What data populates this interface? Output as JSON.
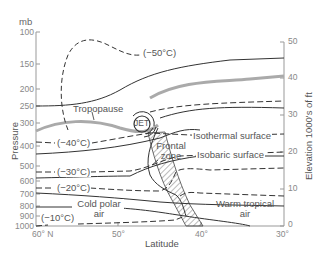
{
  "diagram": {
    "left_axis": {
      "unit": "mb",
      "title": "Pressure",
      "ticks": [
        "100",
        "150",
        "200",
        "250",
        "300",
        "400",
        "500",
        "600",
        "700",
        "800",
        "900",
        "1000"
      ]
    },
    "right_axis": {
      "title": "Elevation  1000's of ft",
      "ticks": [
        "50",
        "40",
        "30",
        "20",
        "10",
        "0"
      ]
    },
    "bottom_axis": {
      "title": "Latitude",
      "ticks": [
        "60° N",
        "50°",
        "40°",
        "30°"
      ]
    },
    "labels": {
      "t_minus50": "(−50°C)",
      "t_minus40": "(−40°C)",
      "t_minus30": "(−30°C)",
      "t_minus20": "(−20°C)",
      "t_minus10": "(−10°C)",
      "tropopause": "Tropopause",
      "jet": "JET",
      "frontal_zone": "Frontal zone",
      "isothermal_surface": "Isothermal surface",
      "isobaric_surface": "Isobaric surface",
      "cold_polar_air": "Cold polar air",
      "warm_tropical_air": "Warm tropical air"
    },
    "colors": {
      "line": "#333333",
      "tropopause": "#aaaaaa",
      "axis": "#999999",
      "hatch": "#555555"
    }
  }
}
